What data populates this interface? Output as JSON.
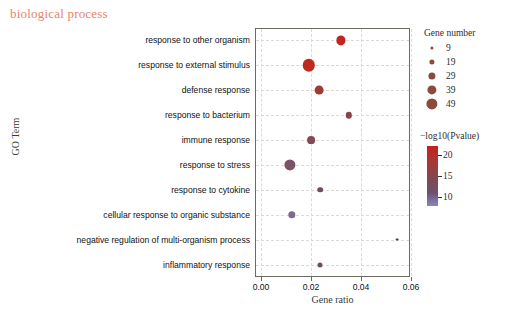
{
  "panel": {
    "title": "biological process",
    "title_color": "#e8836b"
  },
  "axes": {
    "y_title": "GO Term",
    "x_title": "Gene ratio",
    "x_ticks": [
      "0.00",
      "0.02",
      "0.04",
      "0.06"
    ],
    "x_tick_values": [
      0.0,
      0.02,
      0.04,
      0.06
    ]
  },
  "legend_size": {
    "title": "Gene number",
    "entries": [
      {
        "label": "9",
        "radius_px": 1.6
      },
      {
        "label": "19",
        "radius_px": 2.6
      },
      {
        "label": "29",
        "radius_px": 3.6
      },
      {
        "label": "39",
        "radius_px": 4.6
      },
      {
        "label": "49",
        "radius_px": 5.6
      }
    ]
  },
  "legend_color": {
    "title": "−log10(Pvalue)",
    "ticks": [
      "20",
      "15",
      "10"
    ],
    "tick_values": [
      20,
      15,
      10
    ],
    "high_color": "#c4201a",
    "low_color": "#8289c0",
    "range": [
      8,
      22
    ]
  },
  "chart_data": {
    "type": "scatter",
    "title": "biological process",
    "xlabel": "Gene ratio",
    "ylabel": "GO Term",
    "xlim": [
      0.0,
      0.063
    ],
    "grid": true,
    "legend_position": "right",
    "size_legend": "Gene number",
    "color_legend": "-log10(Pvalue)",
    "categories": [
      "response to other organism",
      "response to external stimulus",
      "defense response",
      "response to bacterium",
      "immune response",
      "response to stress",
      "response to cytokine",
      "cellular response to organic substance",
      "negative regulation of multi-organism process",
      "inflammatory response"
    ],
    "points": [
      {
        "term": "response to other organism",
        "gene_ratio": 0.032,
        "gene_number": 32,
        "neg_log10_p": 21.0,
        "color": "#c0281f",
        "radius_px": 4.6
      },
      {
        "term": "response to external stimulus",
        "gene_ratio": 0.0192,
        "gene_number": 49,
        "neg_log10_p": 20.5,
        "color": "#bf2a1c",
        "radius_px": 6.2
      },
      {
        "term": "defense response",
        "gene_ratio": 0.0232,
        "gene_number": 33,
        "neg_log10_p": 18.0,
        "color": "#9e3a33",
        "radius_px": 4.4
      },
      {
        "term": "response to bacterium",
        "gene_ratio": 0.035,
        "gene_number": 22,
        "neg_log10_p": 16.5,
        "color": "#8d4144",
        "radius_px": 3.2
      },
      {
        "term": "immune response",
        "gene_ratio": 0.02,
        "gene_number": 27,
        "neg_log10_p": 15.0,
        "color": "#834a58",
        "radius_px": 3.9
      },
      {
        "term": "response to stress",
        "gene_ratio": 0.0116,
        "gene_number": 44,
        "neg_log10_p": 13.5,
        "color": "#7b5267",
        "radius_px": 5.6
      },
      {
        "term": "response to cytokine",
        "gene_ratio": 0.0236,
        "gene_number": 18,
        "neg_log10_p": 12.0,
        "color": "#6f4f63",
        "radius_px": 2.8
      },
      {
        "term": "cellular response to organic substance",
        "gene_ratio": 0.0124,
        "gene_number": 25,
        "neg_log10_p": 10.5,
        "color": "#7d6b93",
        "radius_px": 3.7
      },
      {
        "term": "negative regulation of multi-organism process",
        "gene_ratio": 0.0544,
        "gene_number": 6,
        "neg_log10_p": 13.0,
        "color": "#4f3c44",
        "radius_px": 1.4
      },
      {
        "term": "inflammatory response",
        "gene_ratio": 0.0236,
        "gene_number": 16,
        "neg_log10_p": 11.5,
        "color": "#6a4f60",
        "radius_px": 2.5
      }
    ]
  }
}
